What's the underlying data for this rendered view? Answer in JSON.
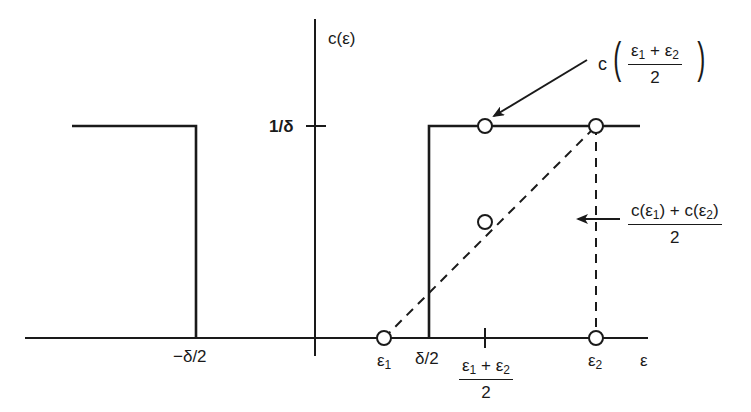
{
  "diagram": {
    "y_axis_label": "c(ε)",
    "x_axis_label": "ε",
    "y_tick_label": "1/δ",
    "x_tick_labels": {
      "neg_half_delta": "−δ/2",
      "half_delta": "δ/2",
      "eps1": "ε",
      "eps1_sub": "1",
      "eps2": "ε",
      "eps2_sub": "2"
    },
    "midpoint_tick": {
      "num_a": "ε",
      "num_a_sub": "1",
      "plus": " + ",
      "num_b": "ε",
      "num_b_sub": "2",
      "den": "2"
    },
    "annotation_top": {
      "prefix": "c",
      "num_a": "ε",
      "num_a_sub": "1",
      "plus": " + ",
      "num_b": "ε",
      "num_b_sub": "2",
      "den": "2"
    },
    "annotation_right": {
      "num_a": "c(ε",
      "num_a_sub": "1",
      "num_mid": ") + c(ε",
      "num_b_sub": "2",
      "num_end": ")",
      "den": "2"
    },
    "colors": {
      "ink": "#1a1a1a",
      "background": "#ffffff"
    },
    "points": [
      {
        "name": "c(eps1)",
        "x": 384,
        "y": 338
      },
      {
        "name": "c(midpoint)",
        "x": 485,
        "y": 126
      },
      {
        "name": "avg(c(eps1),c(eps2))",
        "x": 485,
        "y": 222
      },
      {
        "name": "c(eps2)",
        "x": 596,
        "y": 126
      },
      {
        "name": "eps2-on-axis",
        "x": 596,
        "y": 338
      }
    ]
  }
}
